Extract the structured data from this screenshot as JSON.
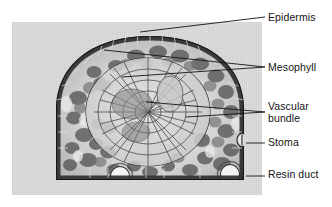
{
  "figure": {
    "kind": "light-micrograph-diagram",
    "background_color": "#ffffff",
    "plate_background_color": "#dcdcdc",
    "line_color": "#1a1a1a",
    "text_color": "#141414"
  },
  "labels": [
    {
      "id": "epidermis",
      "text": "Epidermis"
    },
    {
      "id": "mesophyll",
      "text": "Mesophyll"
    },
    {
      "id": "vascular",
      "line1": "Vascular",
      "line2": "bundle"
    },
    {
      "id": "stoma",
      "text": "Stoma"
    },
    {
      "id": "resin_duct",
      "text": "Resin duct"
    }
  ],
  "structures": {
    "epidermis": "outer dark cell layer forming the dome margin",
    "mesophyll": "mottled ground tissue filling region between epidermis and vascular bundle",
    "vascular_bundle": "central oval of small thin-walled cells",
    "stoma": "pore interrupting epidermis on lower right flank",
    "resin_ducts": "two white circular canals near the flat lower surface"
  }
}
